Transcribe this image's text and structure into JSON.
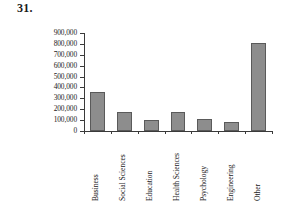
{
  "problem": {
    "number": "31."
  },
  "chart_data": {
    "type": "bar",
    "title": "",
    "subtitle": "",
    "xlabel": "",
    "ylabel": "",
    "categories": [
      "Business",
      "Social Sciences",
      "Education",
      "Health Sciences",
      "Psychology",
      "Engineering",
      "Other"
    ],
    "values": [
      355000,
      175000,
      100000,
      172000,
      110000,
      82000,
      810000
    ],
    "ylim": [
      0,
      900000
    ],
    "ytick_values": [
      0,
      100000,
      200000,
      300000,
      400000,
      500000,
      600000,
      700000,
      800000,
      900000
    ],
    "ytick_labels": [
      "0",
      "100,000",
      "200,000",
      "300,000",
      "400,000",
      "500,000",
      "600,000",
      "700,000",
      "800,000",
      "900,000"
    ],
    "grid": false,
    "legend": null,
    "bar_color": "#8d8d8d",
    "bar_edge_color": "#5a5a5a",
    "axis_color": "#3a3a3a",
    "background": "#ffffff",
    "xtick_label_rotation": 90
  }
}
